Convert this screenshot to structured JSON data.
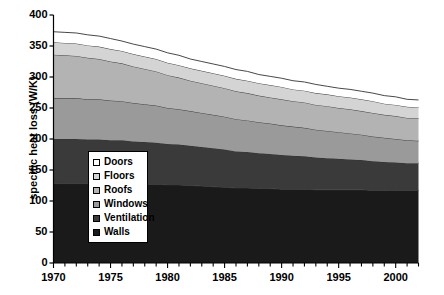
{
  "chart_data": {
    "type": "area",
    "title": "",
    "xlabel": "",
    "ylabel": "specific heat loss (W/K)",
    "xlim": [
      1970,
      2002
    ],
    "ylim": [
      0,
      400
    ],
    "grid": false,
    "stacked": true,
    "legend_position": "inside-lower-left",
    "x_tick_labels": [
      "1970",
      "1975",
      "1980",
      "1985",
      "1990",
      "1995",
      "2000"
    ],
    "x_tick_values": [
      1970,
      1975,
      1980,
      1985,
      1990,
      1995,
      2000
    ],
    "x_minor_tick_step": 1,
    "y_tick_labels": [
      "0",
      "50",
      "100",
      "150",
      "200",
      "250",
      "300",
      "350",
      "400"
    ],
    "y_tick_values": [
      0,
      50,
      100,
      150,
      200,
      250,
      300,
      350,
      400
    ],
    "x": [
      1970,
      1971,
      1972,
      1973,
      1974,
      1975,
      1976,
      1977,
      1978,
      1979,
      1980,
      1981,
      1982,
      1983,
      1984,
      1985,
      1986,
      1987,
      1988,
      1989,
      1990,
      1991,
      1992,
      1993,
      1994,
      1995,
      1996,
      1997,
      1998,
      1999,
      2000,
      2001,
      2002
    ],
    "series": [
      {
        "name": "Walls",
        "color": "#1a1a1a",
        "values": [
          128,
          128,
          128,
          128,
          128,
          128,
          128,
          127,
          127,
          127,
          126,
          126,
          125,
          124,
          123,
          122,
          121,
          121,
          120,
          120,
          119,
          119,
          119,
          118,
          118,
          118,
          118,
          118,
          117,
          117,
          117,
          117,
          117
        ]
      },
      {
        "name": "Ventilation",
        "color": "#3a3a3a",
        "values": [
          72,
          72,
          72,
          71,
          71,
          70,
          70,
          69,
          68,
          67,
          66,
          65,
          64,
          63,
          62,
          61,
          59,
          58,
          57,
          56,
          55,
          54,
          53,
          52,
          51,
          50,
          49,
          48,
          47,
          46,
          45,
          44,
          44
        ]
      },
      {
        "name": "Windows",
        "color": "#9a9a9a",
        "values": [
          66,
          66,
          66,
          65,
          65,
          64,
          63,
          62,
          61,
          60,
          58,
          57,
          56,
          55,
          54,
          53,
          52,
          51,
          50,
          49,
          48,
          47,
          46,
          45,
          44,
          43,
          42,
          41,
          40,
          39,
          38,
          37,
          36
        ]
      },
      {
        "name": "Roofs",
        "color": "#b3b3b3",
        "values": [
          70,
          69,
          68,
          67,
          65,
          63,
          61,
          59,
          57,
          55,
          53,
          51,
          49,
          48,
          47,
          46,
          45,
          44,
          43,
          42,
          42,
          41,
          41,
          40,
          40,
          39,
          39,
          38,
          38,
          37,
          37,
          36,
          36
        ]
      },
      {
        "name": "Floors",
        "color": "#d4d4d4",
        "values": [
          20,
          20,
          20,
          20,
          20,
          20,
          20,
          20,
          20,
          20,
          20,
          20,
          20,
          20,
          20,
          20,
          20,
          20,
          20,
          20,
          20,
          19,
          19,
          19,
          19,
          19,
          19,
          19,
          19,
          18,
          18,
          18,
          18
        ]
      },
      {
        "name": "Doors",
        "color": "#ffffff",
        "values": [
          17,
          17,
          17,
          17,
          17,
          17,
          16,
          16,
          16,
          16,
          16,
          16,
          15,
          15,
          15,
          15,
          15,
          15,
          14,
          14,
          14,
          14,
          14,
          14,
          13,
          13,
          13,
          13,
          13,
          13,
          13,
          12,
          12
        ]
      }
    ]
  },
  "legend": {
    "items": [
      {
        "label": "Doors",
        "color": "#ffffff"
      },
      {
        "label": "Floors",
        "color": "#d4d4d4"
      },
      {
        "label": "Roofs",
        "color": "#b3b3b3"
      },
      {
        "label": "Windows",
        "color": "#9a9a9a"
      },
      {
        "label": "Ventilation",
        "color": "#3a3a3a"
      },
      {
        "label": "Walls",
        "color": "#1a1a1a"
      }
    ]
  },
  "style": {
    "axis_color": "#000000",
    "outline_color": "#333333",
    "background": "#ffffff"
  }
}
